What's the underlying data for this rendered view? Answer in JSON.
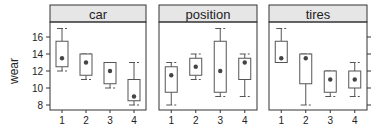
{
  "chart_data": {
    "type": "box",
    "title": "",
    "ylabel": "wear",
    "xlabel": "",
    "ylim": [
      7.2,
      18.0
    ],
    "yticks": [
      8,
      10,
      12,
      14,
      16
    ],
    "y_axis_left_panels": [
      0
    ],
    "y_axis_right_panels": [
      2
    ],
    "categories": [
      "1",
      "2",
      "3",
      "4"
    ],
    "panels": [
      {
        "name": "car",
        "boxes": [
          {
            "x": "1",
            "whisker_low": 12,
            "q1": 12.5,
            "median": 13.5,
            "q3": 15.5,
            "whisker_high": 17
          },
          {
            "x": "2",
            "whisker_low": 11,
            "q1": 11.5,
            "median": 13,
            "q3": 14,
            "whisker_high": 14
          },
          {
            "x": "3",
            "whisker_low": 10,
            "q1": 10.5,
            "median": 12,
            "q3": 13,
            "whisker_high": 13
          },
          {
            "x": "4",
            "whisker_low": 8,
            "q1": 8.5,
            "median": 9,
            "q3": 11,
            "whisker_high": 13
          }
        ]
      },
      {
        "name": "position",
        "boxes": [
          {
            "x": "1",
            "whisker_low": 8,
            "q1": 9.5,
            "median": 11.5,
            "q3": 12.5,
            "whisker_high": 13
          },
          {
            "x": "2",
            "whisker_low": 11,
            "q1": 11.5,
            "median": 12.5,
            "q3": 13.5,
            "whisker_high": 14
          },
          {
            "x": "3",
            "whisker_low": 9,
            "q1": 9.5,
            "median": 12,
            "q3": 15.5,
            "whisker_high": 17
          },
          {
            "x": "4",
            "whisker_low": 9,
            "q1": 11,
            "median": 13,
            "q3": 13.5,
            "whisker_high": 14
          }
        ]
      },
      {
        "name": "tires",
        "boxes": [
          {
            "x": "1",
            "whisker_low": 13,
            "q1": 13,
            "median": 13.5,
            "q3": 15.5,
            "whisker_high": 17
          },
          {
            "x": "2",
            "whisker_low": 8,
            "q1": 10.5,
            "median": 13.5,
            "q3": 14,
            "whisker_high": 14
          },
          {
            "x": "3",
            "whisker_low": 9,
            "q1": 9.5,
            "median": 11,
            "q3": 12,
            "whisker_high": 12
          },
          {
            "x": "4",
            "whisker_low": 9,
            "q1": 10,
            "median": 11,
            "q3": 12,
            "whisker_high": 13
          }
        ]
      }
    ],
    "colors": {
      "strip": "#e6e6e6",
      "frame": "#333333",
      "box": "#555555",
      "median_dot": "#444444"
    }
  }
}
